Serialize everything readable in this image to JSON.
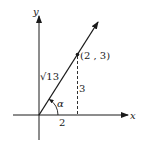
{
  "diagram": {
    "type": "vector-on-coordinate-plane",
    "axes": {
      "x_label": "x",
      "y_label": "y"
    },
    "point": {
      "label": "(2 , 3)",
      "x": 2,
      "y": 3
    },
    "labels": {
      "horizontal_leg": "2",
      "vertical_leg": "3",
      "hypotenuse": "√13",
      "angle": "α"
    },
    "colors": {
      "line": "#1a1a1a",
      "background": "#ffffff"
    }
  }
}
